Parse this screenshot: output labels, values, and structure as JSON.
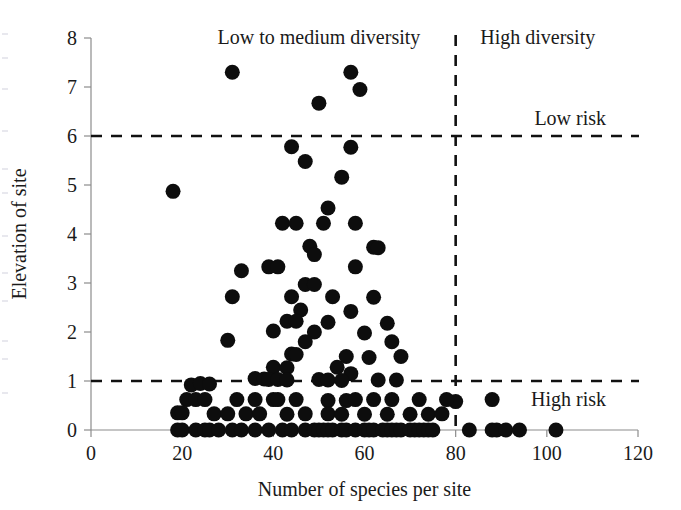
{
  "chart_data": {
    "type": "scatter",
    "title": "",
    "xlabel": "Number of species per site",
    "ylabel": "Elevation of site",
    "xlim": [
      0,
      120
    ],
    "ylim": [
      0,
      8
    ],
    "xticks": [
      0,
      20,
      40,
      60,
      80,
      100,
      120
    ],
    "yticks": [
      0,
      1,
      2,
      3,
      4,
      5,
      6,
      7,
      8
    ],
    "xtick_labels": [
      "0",
      "20",
      "40",
      "60",
      "80",
      "100",
      "120"
    ],
    "ytick_labels": [
      "0",
      "1",
      "2",
      "3",
      "4",
      "5",
      "6",
      "7",
      "8"
    ],
    "grid": false,
    "legend": "none",
    "marker": "filled-circle",
    "marker_color": "#0d0d0d",
    "marker_size": 7.5,
    "annotations": [
      {
        "name": "low-to-medium-diversity",
        "text": "Low to medium diversity",
        "x": 50,
        "y": 8.0,
        "anchor": "middle"
      },
      {
        "name": "high-diversity",
        "text": "High diversity",
        "x": 98,
        "y": 8.0,
        "anchor": "middle"
      },
      {
        "name": "low-risk",
        "text": "Low risk",
        "x": 113,
        "y": 6.35,
        "anchor": "end"
      },
      {
        "name": "high-risk",
        "text": "High risk",
        "x": 113,
        "y": 0.62,
        "anchor": "end"
      }
    ],
    "reference_lines": [
      {
        "name": "low-risk-line",
        "orientation": "horizontal",
        "value": 6,
        "style": "dashed"
      },
      {
        "name": "high-risk-line",
        "orientation": "horizontal",
        "value": 1,
        "style": "dashed"
      },
      {
        "name": "diversity-threshold-line",
        "orientation": "vertical",
        "value": 80,
        "style": "dashed"
      }
    ],
    "points": [
      [
        31,
        7.3
      ],
      [
        57,
        7.3
      ],
      [
        59,
        6.95
      ],
      [
        50,
        6.67
      ],
      [
        44,
        5.78
      ],
      [
        57,
        5.77
      ],
      [
        47,
        5.48
      ],
      [
        55,
        5.16
      ],
      [
        18,
        4.87
      ],
      [
        52,
        4.53
      ],
      [
        42,
        4.22
      ],
      [
        45,
        4.22
      ],
      [
        51,
        4.22
      ],
      [
        58,
        4.22
      ],
      [
        48,
        3.75
      ],
      [
        62,
        3.73
      ],
      [
        63,
        3.72
      ],
      [
        49,
        3.58
      ],
      [
        39,
        3.33
      ],
      [
        41,
        3.33
      ],
      [
        58,
        3.33
      ],
      [
        33,
        3.25
      ],
      [
        47,
        2.97
      ],
      [
        49,
        2.97
      ],
      [
        31,
        2.72
      ],
      [
        44,
        2.72
      ],
      [
        53,
        2.72
      ],
      [
        62,
        2.71
      ],
      [
        46,
        2.45
      ],
      [
        57,
        2.42
      ],
      [
        43,
        2.22
      ],
      [
        45,
        2.22
      ],
      [
        52,
        2.2
      ],
      [
        65,
        2.18
      ],
      [
        40,
        2.02
      ],
      [
        49,
        2.0
      ],
      [
        60,
        1.98
      ],
      [
        30,
        1.83
      ],
      [
        47,
        1.8
      ],
      [
        66,
        1.8
      ],
      [
        44,
        1.55
      ],
      [
        45,
        1.54
      ],
      [
        56,
        1.5
      ],
      [
        61,
        1.48
      ],
      [
        68,
        1.5
      ],
      [
        40,
        1.28
      ],
      [
        43,
        1.27
      ],
      [
        54,
        1.28
      ],
      [
        57,
        1.15
      ],
      [
        36,
        1.05
      ],
      [
        38,
        1.04
      ],
      [
        39,
        1.03
      ],
      [
        41,
        1.03
      ],
      [
        43,
        1.02
      ],
      [
        50,
        1.03
      ],
      [
        52,
        1.02
      ],
      [
        55,
        1.01
      ],
      [
        63,
        1.02
      ],
      [
        67,
        1.02
      ],
      [
        22,
        0.92
      ],
      [
        24,
        0.95
      ],
      [
        26,
        0.94
      ],
      [
        80,
        0.58
      ],
      [
        21,
        0.62
      ],
      [
        23,
        0.62
      ],
      [
        25,
        0.62
      ],
      [
        32,
        0.62
      ],
      [
        36,
        0.62
      ],
      [
        40,
        0.62
      ],
      [
        41,
        0.62
      ],
      [
        45,
        0.62
      ],
      [
        52,
        0.6
      ],
      [
        56,
        0.6
      ],
      [
        58,
        0.62
      ],
      [
        62,
        0.62
      ],
      [
        66,
        0.62
      ],
      [
        72,
        0.62
      ],
      [
        78,
        0.62
      ],
      [
        88,
        0.62
      ],
      [
        19,
        0.35
      ],
      [
        20,
        0.35
      ],
      [
        27,
        0.33
      ],
      [
        30,
        0.33
      ],
      [
        34,
        0.33
      ],
      [
        37,
        0.33
      ],
      [
        43,
        0.32
      ],
      [
        47,
        0.33
      ],
      [
        52,
        0.33
      ],
      [
        55,
        0.32
      ],
      [
        60,
        0.32
      ],
      [
        65,
        0.32
      ],
      [
        70,
        0.32
      ],
      [
        74,
        0.32
      ],
      [
        77,
        0.33
      ],
      [
        19,
        0.0
      ],
      [
        20,
        0.0
      ],
      [
        23,
        0.0
      ],
      [
        25,
        0.0
      ],
      [
        26,
        0.0
      ],
      [
        28,
        0.0
      ],
      [
        31,
        0.0
      ],
      [
        33,
        0.0
      ],
      [
        36,
        0.0
      ],
      [
        39,
        0.0
      ],
      [
        42,
        0.0
      ],
      [
        44,
        0.0
      ],
      [
        47,
        0.0
      ],
      [
        49,
        0.0
      ],
      [
        50,
        0.0
      ],
      [
        51,
        0.0
      ],
      [
        52,
        0.0
      ],
      [
        53,
        0.0
      ],
      [
        55,
        0.0
      ],
      [
        56,
        0.0
      ],
      [
        58,
        0.0
      ],
      [
        60,
        0.0
      ],
      [
        61,
        0.0
      ],
      [
        62,
        0.0
      ],
      [
        64,
        0.0
      ],
      [
        65,
        0.0
      ],
      [
        66,
        0.0
      ],
      [
        67,
        0.0
      ],
      [
        68,
        0.0
      ],
      [
        70,
        0.0
      ],
      [
        71,
        0.0
      ],
      [
        72,
        0.0
      ],
      [
        73,
        0.0
      ],
      [
        74,
        0.0
      ],
      [
        75,
        0.0
      ],
      [
        83,
        0.0
      ],
      [
        88,
        0.0
      ],
      [
        89,
        0.0
      ],
      [
        91,
        0.0
      ],
      [
        94,
        0.0
      ],
      [
        102,
        0.0
      ]
    ]
  }
}
